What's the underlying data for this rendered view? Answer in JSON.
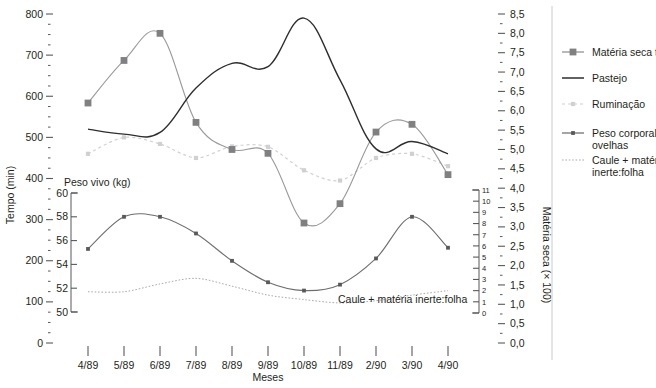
{
  "chart_data": {
    "type": "line",
    "title": "",
    "xlabel": "Meses",
    "grid": false,
    "legend_position": "right",
    "categories": [
      "4/89",
      "5/89",
      "6/89",
      "7/89",
      "8/89",
      "9/89",
      "10/89",
      "11/89",
      "2/90",
      "3/90",
      "4/90"
    ],
    "axes": {
      "tempo": {
        "label": "Tempo (min)",
        "position": "left-outer",
        "min": 0,
        "max": 800,
        "step": 100,
        "minor_step": 25,
        "ticks": [
          "0",
          "100",
          "200",
          "300",
          "400",
          "500",
          "600",
          "700",
          "800"
        ]
      },
      "peso_vivo": {
        "label": "Peso vivo (kg)",
        "position": "left-inner",
        "min": 50,
        "max": 60,
        "step": 2,
        "ticks": [
          "50",
          "52",
          "54",
          "56",
          "58",
          "60"
        ]
      },
      "caule_folha": {
        "label": "",
        "position": "right-inner",
        "min": 0,
        "max": 11,
        "step": 1,
        "ticks": [
          "0",
          "1",
          "2",
          "3",
          "4",
          "5",
          "6",
          "7",
          "8",
          "9",
          "10",
          "11"
        ]
      },
      "materia_seca": {
        "label": "Matéria seca (× 100)",
        "position": "right-outer",
        "min": 0.0,
        "max": 8.5,
        "step": 0.5,
        "ticks": [
          "0,0",
          "0,5",
          "1,0",
          "1,5",
          "2,0",
          "2,5",
          "3,0",
          "3,5",
          "4,0",
          "4,5",
          "5,0",
          "5,5",
          "6,0",
          "6,5",
          "7,0",
          "7,5",
          "8,0",
          "8,5"
        ]
      }
    },
    "series": [
      {
        "name": "Matéria seca total",
        "axis": "materia_seca",
        "marker": "square",
        "color": "#808082",
        "style": "solid-light",
        "values": [
          6.2,
          7.3,
          8.0,
          5.7,
          5.0,
          4.9,
          3.1,
          3.6,
          5.45,
          5.65,
          4.35
        ]
      },
      {
        "name": "Pastejo",
        "axis": "tempo",
        "marker": "none",
        "color": "#2e2e30",
        "style": "solid",
        "values": [
          520,
          508,
          512,
          620,
          680,
          672,
          790,
          640,
          472,
          490,
          460
        ]
      },
      {
        "name": "Ruminação",
        "axis": "tempo",
        "marker": "dot",
        "color": "#cfd0d2",
        "style": "dashed",
        "values": [
          460,
          500,
          484,
          450,
          478,
          477,
          420,
          395,
          450,
          460,
          430
        ]
      },
      {
        "name": "Peso corporal das ovelhas",
        "axis": "peso_vivo",
        "marker": "dot",
        "color": "#58595b",
        "style": "solid",
        "values": [
          55.3,
          58.0,
          58.0,
          56.6,
          54.3,
          52.5,
          51.8,
          52.3,
          54.5,
          58.0,
          55.4
        ]
      },
      {
        "name": "Caule + matéria inerte:folha",
        "axis": "caule_folha",
        "marker": "none",
        "color": "#a9aaac",
        "style": "dotted",
        "values": [
          1.9,
          1.9,
          2.6,
          3.1,
          2.4,
          1.6,
          1.2,
          0.9,
          1.1,
          1.6,
          2.0
        ]
      }
    ],
    "annotations": [
      {
        "text": "Caule + matéria inerte:folha",
        "x": 338,
        "y": 303
      }
    ]
  },
  "legend": {
    "items": [
      {
        "label": "Matéria seca total",
        "marker": "square-line",
        "color": "#808082"
      },
      {
        "label": "Pastejo",
        "marker": "line",
        "color": "#2e2e30"
      },
      {
        "label": "Ruminação",
        "marker": "dot-dashed",
        "color": "#cfd0d2"
      },
      {
        "label": "Peso corporal das ovelhas",
        "marker": "dot-line",
        "color": "#58595b"
      },
      {
        "label": "Caule + matéria inerte:folha",
        "marker": "dotted-line",
        "color": "#a9aaac"
      }
    ]
  }
}
